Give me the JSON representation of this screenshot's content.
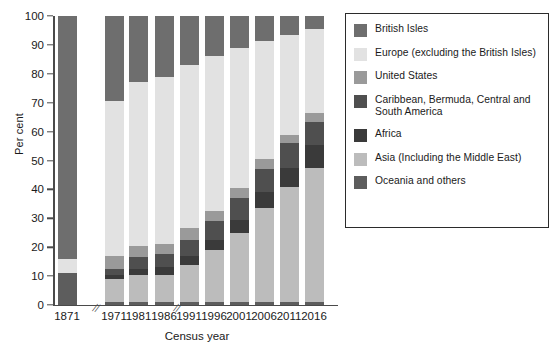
{
  "chart_data": {
    "type": "bar",
    "stacked": true,
    "title": "",
    "xlabel": "Census year",
    "ylabel": "Per cent",
    "ylim": [
      0,
      100
    ],
    "yticks": [
      0,
      10,
      20,
      30,
      40,
      50,
      60,
      70,
      80,
      90,
      100
    ],
    "grid": false,
    "legend_position": "right",
    "axis_breaks": [
      "after 1871",
      "after 1981"
    ],
    "categories": [
      "1871",
      "1971",
      "1981",
      "1986",
      "1991",
      "1996",
      "2001",
      "2006",
      "2011",
      "2016"
    ],
    "series": [
      {
        "name": "British Isles",
        "color": "#6e6e6e",
        "values": [
          84.0,
          29.5,
          23.0,
          21.0,
          17.0,
          14.0,
          11.0,
          8.5,
          6.5,
          4.5
        ]
      },
      {
        "name": "Europe (excluding the British Isles)",
        "color": "#e2e2e2",
        "values": [
          5.0,
          53.5,
          56.5,
          58.0,
          56.5,
          53.5,
          48.5,
          41.0,
          34.5,
          29.0
        ]
      },
      {
        "name": "United States",
        "color": "#9a9a9a",
        "values": [
          0.0,
          4.5,
          4.0,
          3.5,
          4.0,
          3.5,
          3.5,
          3.5,
          3.0,
          3.0
        ]
      },
      {
        "name": "Caribbean, Bermuda, Central and South America",
        "color": "#4f4f4f",
        "values": [
          0.0,
          2.0,
          4.0,
          4.5,
          5.5,
          6.5,
          7.5,
          8.0,
          8.5,
          8.0
        ]
      },
      {
        "name": "Africa",
        "color": "#3a3a3a",
        "values": [
          0.0,
          1.5,
          2.0,
          2.5,
          3.0,
          3.5,
          4.5,
          5.5,
          6.5,
          8.0
        ]
      },
      {
        "name": "Asia (Including the Middle East)",
        "color": "#bcbcbc",
        "values": [
          0.0,
          8.0,
          9.5,
          9.5,
          13.0,
          18.0,
          24.0,
          32.5,
          40.0,
          46.5
        ]
      },
      {
        "name": "Oceania and others",
        "color": "#5d5d5d",
        "values": [
          11.0,
          1.0,
          1.0,
          1.0,
          1.0,
          1.0,
          1.0,
          1.0,
          1.0,
          1.0
        ]
      }
    ]
  },
  "legend": {
    "items": [
      {
        "label": "British Isles"
      },
      {
        "label": "Europe (excluding the British Isles)"
      },
      {
        "label": "United States"
      },
      {
        "label": "Caribbean, Bermuda, Central and South America"
      },
      {
        "label": "Africa"
      },
      {
        "label": "Asia (Including the Middle East)"
      },
      {
        "label": "Oceania and others"
      }
    ]
  }
}
